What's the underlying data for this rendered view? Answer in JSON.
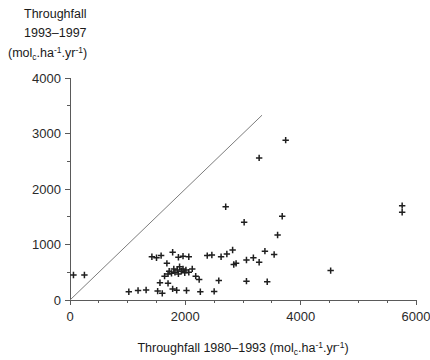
{
  "chart_data": {
    "type": "scatter",
    "title": "",
    "ylabel_lines": [
      "Throughfall",
      "1993-1997",
      "(mol_c.ha-1.yr-1)"
    ],
    "ylabel_line1": "Throughfall",
    "ylabel_line2": "1993–1997",
    "ylabel_unit_prefix": "(mol",
    "ylabel_unit_sub": "c",
    "ylabel_unit_mid": ".ha",
    "ylabel_unit_sup1": "-1",
    "ylabel_unit_mid2": ".yr",
    "ylabel_unit_sup2": "-1",
    "ylabel_unit_suffix": ")",
    "xlabel_prefix": "Throughfall 1980–1993 (mol",
    "xlabel_sub": "c",
    "xlabel_mid": ".ha",
    "xlabel_sup1": "-1",
    "xlabel_mid2": ".yr",
    "xlabel_sup2": "-1",
    "xlabel_suffix": ")",
    "xlim": [
      0,
      6000
    ],
    "ylim": [
      0,
      4000
    ],
    "xticks": [
      0,
      2000,
      4000,
      6000
    ],
    "xtick_labels": [
      "0",
      "2000",
      "4000",
      "6000"
    ],
    "xminor_step": 500,
    "yticks": [
      0,
      1000,
      2000,
      3000,
      4000
    ],
    "ytick_labels": [
      "0",
      "1000",
      "2000",
      "3000",
      "4000"
    ],
    "grid": false,
    "legend": "none",
    "marker": "plus",
    "marker_color": "#1f1f1f",
    "reference_line": {
      "label": "1:1 line",
      "from": [
        0,
        0
      ],
      "to": [
        3330,
        3330
      ],
      "color": "#7d7d7d"
    },
    "points": [
      [
        60,
        450
      ],
      [
        250,
        450
      ],
      [
        1020,
        150
      ],
      [
        1180,
        170
      ],
      [
        1320,
        180
      ],
      [
        1520,
        160
      ],
      [
        1560,
        310
      ],
      [
        1700,
        300
      ],
      [
        1600,
        120
      ],
      [
        1780,
        200
      ],
      [
        1850,
        175
      ],
      [
        2020,
        170
      ],
      [
        2260,
        150
      ],
      [
        2500,
        155
      ],
      [
        1640,
        430
      ],
      [
        1700,
        470
      ],
      [
        1720,
        520
      ],
      [
        1760,
        480
      ],
      [
        1800,
        560
      ],
      [
        1820,
        500
      ],
      [
        1860,
        540
      ],
      [
        1880,
        470
      ],
      [
        1900,
        600
      ],
      [
        1930,
        520
      ],
      [
        1960,
        560
      ],
      [
        1990,
        490
      ],
      [
        2010,
        540
      ],
      [
        2060,
        500
      ],
      [
        2120,
        560
      ],
      [
        2180,
        430
      ],
      [
        2240,
        370
      ],
      [
        1420,
        780
      ],
      [
        1500,
        760
      ],
      [
        1580,
        800
      ],
      [
        1680,
        660
      ],
      [
        1780,
        860
      ],
      [
        1880,
        770
      ],
      [
        1960,
        790
      ],
      [
        2060,
        780
      ],
      [
        2380,
        800
      ],
      [
        2460,
        810
      ],
      [
        2620,
        780
      ],
      [
        2720,
        830
      ],
      [
        2820,
        900
      ],
      [
        2840,
        640
      ],
      [
        2880,
        660
      ],
      [
        3060,
        720
      ],
      [
        3180,
        760
      ],
      [
        3280,
        680
      ],
      [
        3380,
        880
      ],
      [
        3540,
        820
      ],
      [
        3600,
        1170
      ],
      [
        3680,
        1510
      ],
      [
        3020,
        1400
      ],
      [
        2700,
        1680
      ],
      [
        3280,
        2560
      ],
      [
        3740,
        2880
      ],
      [
        4520,
        530
      ],
      [
        3420,
        330
      ],
      [
        3060,
        340
      ],
      [
        2580,
        350
      ],
      [
        5760,
        1700
      ],
      [
        5760,
        1580
      ]
    ]
  }
}
